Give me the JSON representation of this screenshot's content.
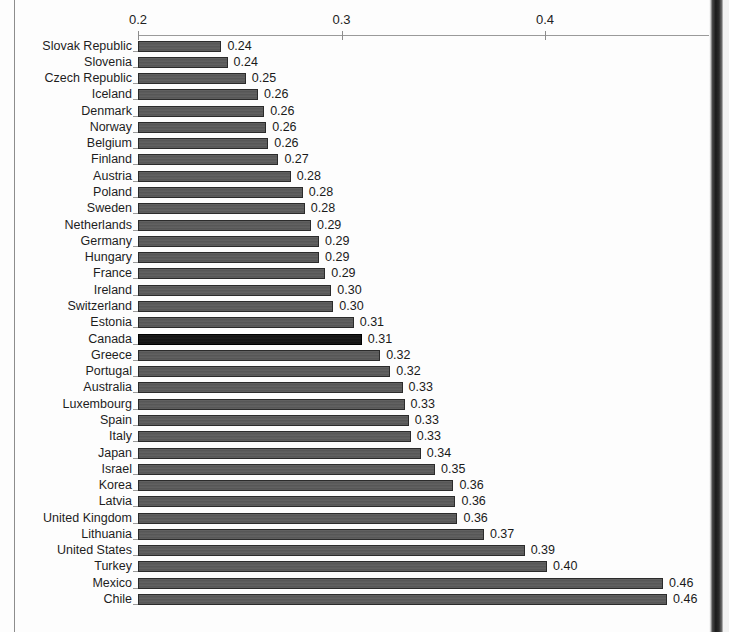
{
  "chart_data": {
    "type": "bar",
    "orientation": "horizontal",
    "title": "",
    "subtitle": "",
    "xlabel": "",
    "ylabel": "",
    "xlim": [
      0.2,
      0.481
    ],
    "axis_start": 0.2,
    "grid": false,
    "legend": null,
    "tick_labels": [
      "0.2",
      "0.3",
      "0.4"
    ],
    "ticks": [
      0.2,
      0.3,
      0.4
    ],
    "value_label_format": "0.00",
    "highlight_category": "Canada",
    "categories": [
      "Slovak Republic",
      "Slovenia",
      "Czech Republic",
      "Iceland",
      "Denmark",
      "Norway",
      "Belgium",
      "Finland",
      "Austria",
      "Poland",
      "Sweden",
      "Netherlands",
      "Germany",
      "Hungary",
      "France",
      "Ireland",
      "Switzerland",
      "Estonia",
      "Canada",
      "Greece",
      "Portugal",
      "Australia",
      "Luxembourg",
      "Spain",
      "Italy",
      "Japan",
      "Israel",
      "Korea",
      "Latvia",
      "United Kingdom",
      "Lithuania",
      "United States",
      "Turkey",
      "Mexico",
      "Chile"
    ],
    "values": [
      0.241,
      0.244,
      0.253,
      0.259,
      0.262,
      0.263,
      0.264,
      0.269,
      0.275,
      0.281,
      0.282,
      0.285,
      0.289,
      0.289,
      0.292,
      0.295,
      0.296,
      0.306,
      0.31,
      0.319,
      0.324,
      0.33,
      0.331,
      0.333,
      0.334,
      0.339,
      0.346,
      0.355,
      0.356,
      0.357,
      0.37,
      0.39,
      0.401,
      0.458,
      0.46
    ],
    "labels": [
      "0.24",
      "0.24",
      "0.25",
      "0.26",
      "0.26",
      "0.26",
      "0.26",
      "0.27",
      "0.28",
      "0.28",
      "0.28",
      "0.29",
      "0.29",
      "0.29",
      "0.29",
      "0.30",
      "0.30",
      "0.31",
      "0.31",
      "0.32",
      "0.32",
      "0.33",
      "0.33",
      "0.33",
      "0.33",
      "0.34",
      "0.35",
      "0.36",
      "0.36",
      "0.36",
      "0.37",
      "0.39",
      "0.40",
      "0.46",
      "0.46"
    ],
    "colors": {
      "bar": "#595959",
      "bar_highlight": "#141414",
      "bar_border": "#2b2b2b",
      "axis": "#9a9a9a",
      "text": "#1d1d1d",
      "page": "#fdfdfd"
    }
  }
}
